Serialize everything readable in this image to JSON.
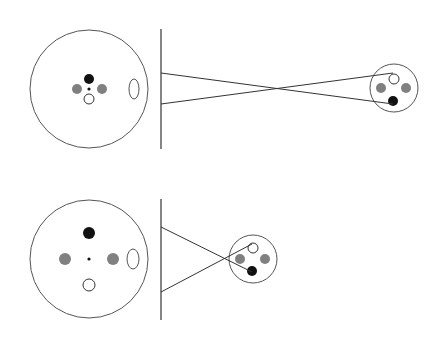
{
  "colors": {
    "background": "#ffffff",
    "stroke": "#333333",
    "outline": "#555555",
    "black_dot": "#111111",
    "gray_dot": "#808080",
    "white_dot": "#ffffff"
  },
  "panels": [
    {
      "name": "top-panel",
      "object": {
        "cx": 89,
        "cy": 89,
        "r": 59
      },
      "object_dots": [
        {
          "kind": "black",
          "cx": 89,
          "cy": 79,
          "r": 5
        },
        {
          "kind": "gray",
          "cx": 77,
          "cy": 89,
          "r": 5
        },
        {
          "kind": "gray",
          "cx": 102,
          "cy": 89,
          "r": 5
        },
        {
          "kind": "center",
          "cx": 89,
          "cy": 89,
          "r": 1.6
        },
        {
          "kind": "white",
          "cx": 89,
          "cy": 99,
          "r": 5
        }
      ],
      "ellipse": {
        "cx": 134,
        "cy": 89,
        "rx": 5,
        "ry": 10
      },
      "screen": {
        "x": 161,
        "y1": 29,
        "y2": 149
      },
      "rays": [
        {
          "x1": 161,
          "y1": 73,
          "x2": 393,
          "y2": 104
        },
        {
          "x1": 161,
          "y1": 104,
          "x2": 393,
          "y2": 73
        }
      ],
      "image": {
        "cx": 394,
        "cy": 88,
        "r": 24
      },
      "image_dots": [
        {
          "kind": "white",
          "cx": 394,
          "cy": 79,
          "r": 5
        },
        {
          "kind": "gray",
          "cx": 381,
          "cy": 88,
          "r": 5
        },
        {
          "kind": "gray",
          "cx": 406,
          "cy": 88,
          "r": 5
        },
        {
          "kind": "black",
          "cx": 393,
          "cy": 101,
          "r": 5
        }
      ]
    },
    {
      "name": "bottom-panel",
      "object": {
        "cx": 89,
        "cy": 259,
        "r": 59
      },
      "object_dots": [
        {
          "kind": "black",
          "cx": 89,
          "cy": 233,
          "r": 6
        },
        {
          "kind": "gray",
          "cx": 65,
          "cy": 259,
          "r": 6
        },
        {
          "kind": "gray",
          "cx": 113,
          "cy": 259,
          "r": 6
        },
        {
          "kind": "center",
          "cx": 89,
          "cy": 259,
          "r": 1.6
        },
        {
          "kind": "white",
          "cx": 89,
          "cy": 285,
          "r": 6
        }
      ],
      "ellipse": {
        "cx": 133,
        "cy": 259,
        "rx": 6,
        "ry": 10
      },
      "screen": {
        "x": 161,
        "y1": 199,
        "y2": 320
      },
      "rays": [
        {
          "x1": 161,
          "y1": 227,
          "x2": 252,
          "y2": 272
        },
        {
          "x1": 161,
          "y1": 292,
          "x2": 252,
          "y2": 244
        }
      ],
      "image": {
        "cx": 253,
        "cy": 259,
        "r": 24
      },
      "image_dots": [
        {
          "kind": "white",
          "cx": 253,
          "cy": 248,
          "r": 5
        },
        {
          "kind": "gray",
          "cx": 240,
          "cy": 259,
          "r": 5
        },
        {
          "kind": "gray",
          "cx": 265,
          "cy": 259,
          "r": 5
        },
        {
          "kind": "black",
          "cx": 252,
          "cy": 271,
          "r": 5
        }
      ]
    }
  ]
}
